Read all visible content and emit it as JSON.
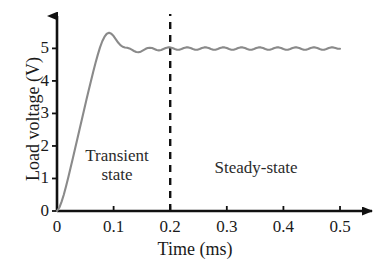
{
  "chart_data": {
    "type": "line",
    "title": "",
    "subtitle": "",
    "xlabel": "Time (ms)",
    "ylabel": "Load voltage (V)",
    "xlim": [
      0,
      0.53
    ],
    "ylim": [
      0,
      5.75
    ],
    "xticks": [
      "0",
      "0.1",
      "0.2",
      "0.3",
      "0.4",
      "0.5"
    ],
    "xtick_values": [
      0,
      0.1,
      0.2,
      0.3,
      0.4,
      0.5
    ],
    "yticks": [
      "0",
      "1",
      "2",
      "3",
      "4",
      "5"
    ],
    "ytick_values": [
      0,
      1,
      2,
      3,
      4,
      5
    ],
    "grid": false,
    "legend": null,
    "legend_position": "none",
    "series": [
      {
        "name": "Load voltage",
        "color": "#8a8a8a",
        "x": [
          0.0,
          0.004,
          0.008,
          0.012,
          0.016,
          0.02,
          0.024,
          0.028,
          0.032,
          0.036,
          0.04,
          0.044,
          0.048,
          0.052,
          0.056,
          0.06,
          0.064,
          0.068,
          0.072,
          0.076,
          0.08,
          0.084,
          0.088,
          0.092,
          0.096,
          0.1,
          0.104,
          0.108,
          0.112,
          0.116,
          0.12,
          0.124,
          0.128,
          0.132,
          0.136,
          0.14,
          0.144,
          0.148,
          0.152,
          0.156,
          0.16,
          0.164,
          0.168,
          0.172,
          0.176,
          0.18,
          0.184,
          0.188,
          0.192,
          0.196,
          0.2,
          0.204,
          0.208,
          0.212,
          0.216,
          0.22,
          0.224,
          0.228,
          0.232,
          0.236,
          0.24,
          0.244,
          0.248,
          0.252,
          0.256,
          0.26,
          0.264,
          0.268,
          0.272,
          0.276,
          0.28,
          0.284,
          0.288,
          0.292,
          0.296,
          0.3,
          0.304,
          0.308,
          0.312,
          0.316,
          0.32,
          0.324,
          0.328,
          0.332,
          0.336,
          0.34,
          0.344,
          0.348,
          0.352,
          0.356,
          0.36,
          0.364,
          0.368,
          0.372,
          0.376,
          0.38,
          0.384,
          0.388,
          0.392,
          0.396,
          0.4,
          0.404,
          0.408,
          0.412,
          0.416,
          0.42,
          0.424,
          0.428,
          0.432,
          0.436,
          0.44,
          0.444,
          0.448,
          0.452,
          0.456,
          0.46,
          0.464,
          0.468,
          0.472,
          0.476,
          0.48,
          0.484,
          0.488,
          0.492,
          0.496,
          0.5
        ],
        "y": [
          0.0,
          0.1,
          0.28,
          0.5,
          0.76,
          1.04,
          1.33,
          1.62,
          1.92,
          2.22,
          2.52,
          2.82,
          3.12,
          3.42,
          3.71,
          4.0,
          4.28,
          4.55,
          4.8,
          5.03,
          5.22,
          5.36,
          5.45,
          5.48,
          5.45,
          5.38,
          5.28,
          5.18,
          5.1,
          5.05,
          5.03,
          5.02,
          5.0,
          4.96,
          4.92,
          4.89,
          4.88,
          4.9,
          4.94,
          4.98,
          5.01,
          5.02,
          5.01,
          4.98,
          4.95,
          4.94,
          4.95,
          4.98,
          5.01,
          5.03,
          5.03,
          5.01,
          4.98,
          4.96,
          4.96,
          4.98,
          5.01,
          5.03,
          5.03,
          5.01,
          4.98,
          4.96,
          4.96,
          4.98,
          5.01,
          5.03,
          5.03,
          5.01,
          4.98,
          4.96,
          4.96,
          4.98,
          5.01,
          5.03,
          5.03,
          5.01,
          4.98,
          4.96,
          4.96,
          4.98,
          5.01,
          5.03,
          5.03,
          5.01,
          4.98,
          4.96,
          4.96,
          4.98,
          5.01,
          5.03,
          5.03,
          5.01,
          4.98,
          4.96,
          4.96,
          4.98,
          5.01,
          5.03,
          5.03,
          5.01,
          4.98,
          4.96,
          4.96,
          4.98,
          5.01,
          5.03,
          5.03,
          5.01,
          4.98,
          4.96,
          4.96,
          4.98,
          5.01,
          5.03,
          5.03,
          5.01,
          4.98,
          4.96,
          4.96,
          4.98,
          5.01,
          5.03,
          5.03,
          5.01,
          4.99,
          4.99
        ]
      }
    ],
    "annotations": [
      {
        "name": "transient-state",
        "text": "Transient\nstate",
        "x": 0.105,
        "y": 1.55
      },
      {
        "name": "steady-state",
        "text": "Steady-state",
        "x": 0.35,
        "y": 1.35
      }
    ],
    "reference_lines": [
      {
        "name": "state-boundary",
        "orientation": "vertical",
        "value": 0.2,
        "style": "dashed",
        "color": "#111111"
      }
    ],
    "overshoot_peak_v": 5.5,
    "overshoot_time_ms": 0.085,
    "settling_value_v": 5.0
  },
  "axes": {
    "x_title": "Time (ms)",
    "y_title": "Load voltage (V)"
  },
  "colors": {
    "curve": "#8a8a8a",
    "axis": "#111111",
    "dashed": "#111111",
    "text": "#1a1a1a",
    "background": "#ffffff"
  }
}
